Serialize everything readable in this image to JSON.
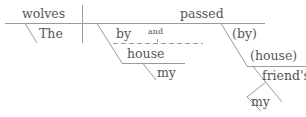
{
  "diagram": {
    "type": "sentence-diagram",
    "sentence_parts": {
      "subject": "wolves",
      "subject_modifier": "The",
      "verb": "passed",
      "prep1": "by",
      "conjunction": "and",
      "prep1_object": "house",
      "prep1_object_modifier": "my",
      "prep2": "(by)",
      "prep2_object": "(house)",
      "prep2_object_modifier": "friend's",
      "possessive_modifier": "my"
    },
    "colors": {
      "line": "#999999",
      "text": "#555555"
    }
  }
}
